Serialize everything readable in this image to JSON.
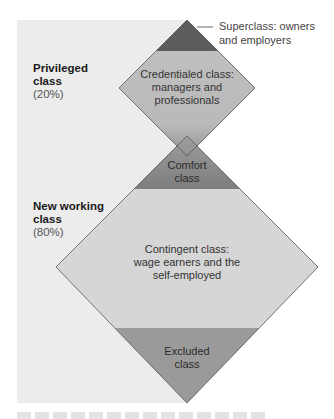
{
  "diagram": {
    "type": "hourglass-class-structure",
    "groups": [
      {
        "name": "Privileged class",
        "share": "(20%)"
      },
      {
        "name": "New working class",
        "share": "(80%)"
      }
    ],
    "segments": [
      {
        "id": "superclass",
        "label": "Superclass: owners and employers",
        "fill": "#5c5c5c"
      },
      {
        "id": "credentialed",
        "label_lines": [
          "Credentialed class:",
          "managers and",
          "professionals"
        ],
        "fill": "#b9b9b9"
      },
      {
        "id": "comfort",
        "label_lines": [
          "Comfort",
          "class"
        ],
        "fill": "#8a8a8a"
      },
      {
        "id": "contingent",
        "label_lines": [
          "Contingent class:",
          "wage earners and the",
          "self-employed"
        ],
        "fill": "#d6d6d6"
      },
      {
        "id": "excluded",
        "label_lines": [
          "Excluded",
          "class"
        ],
        "fill": "#9a9a9a"
      }
    ],
    "callout": {
      "line1": "Superclass: owners",
      "line2": "and employers"
    },
    "colors": {
      "panel": "#ececec",
      "outline": "#555555",
      "text": "#1a1a1a"
    }
  }
}
